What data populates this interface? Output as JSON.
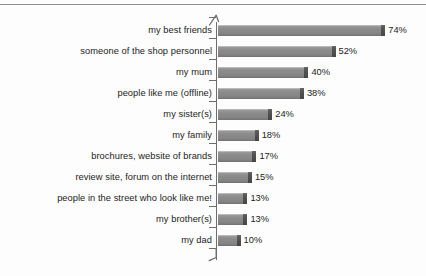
{
  "chart_data": {
    "type": "bar",
    "orientation": "horizontal",
    "title": "",
    "subtitle": "",
    "xlabel": "",
    "ylabel": "",
    "xlim": [
      0,
      80
    ],
    "grid": false,
    "legend": null,
    "value_suffix": "%",
    "categories": [
      "my best friends",
      "someone of the shop personnel",
      "my mum",
      "people like me (offline)",
      "my sister(s)",
      "my family",
      "brochures, website of brands",
      "review site, forum on the internet",
      "people in the street who look like me!",
      "my brother(s)",
      "my dad"
    ],
    "values": [
      74,
      52,
      40,
      38,
      24,
      18,
      17,
      15,
      13,
      13,
      10
    ],
    "value_labels": [
      "74%",
      "52%",
      "40%",
      "38%",
      "24%",
      "18%",
      "17%",
      "15%",
      "13%",
      "13%",
      "10%"
    ],
    "colors": {
      "bar_fill": "#8b8b8b",
      "bar_highlight": "#b9b9b9",
      "bar_end_cap": "#4e4e4e",
      "axis": "#6d6d6d",
      "text": "#1c1c1c",
      "background": "#fdfdfd",
      "top_rule": "#8d8f94"
    }
  }
}
